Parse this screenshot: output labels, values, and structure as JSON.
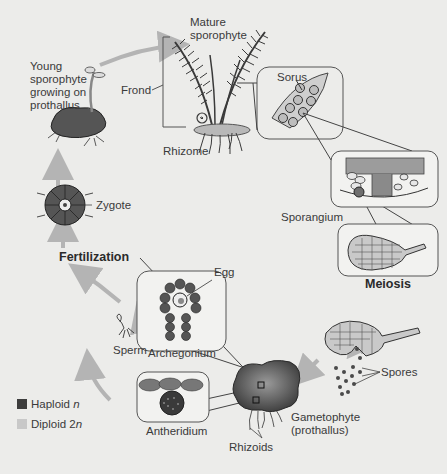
{
  "diagram": {
    "labels": {
      "mature_sporophyte": [
        "Mature",
        "sporophyte"
      ],
      "young_sporophyte": [
        "Young",
        "sporophyte",
        "growing on",
        "prothallus"
      ],
      "frond": "Frond",
      "rhizome": "Rhizome",
      "sorus": "Sorus",
      "sporangium": "Sporangium",
      "meiosis": "Meiosis",
      "spores": "Spores",
      "gametophyte": [
        "Gametophyte",
        "(prothallus)"
      ],
      "rhizoids": "Rhizoids",
      "antheridium": "Antheridium",
      "archegonium": "Archegonium",
      "sperm": "Sperm",
      "egg": "Egg",
      "fertilization": "Fertilization",
      "zygote": "Zygote"
    },
    "legend": [
      {
        "label": "Haploid ",
        "symbol": "n",
        "color": "#3d3d3d"
      },
      {
        "label": "Diploid 2",
        "symbol": "n",
        "color": "#c8c8c8"
      }
    ],
    "colors": {
      "haploid": "#3d3d3d",
      "diploid": "#c8c8c8",
      "arrow": "#b4b4b4",
      "outline": "#444444",
      "background": "#ececea"
    }
  }
}
